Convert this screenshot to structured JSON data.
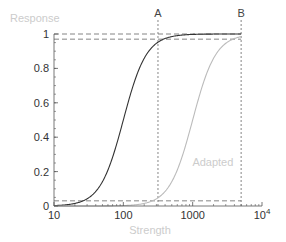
{
  "chart_data": {
    "type": "line",
    "title": "",
    "xlabel": "Strength",
    "ylabel": "Response",
    "xscale": "log",
    "xlim": [
      10,
      10000
    ],
    "ylim": [
      0,
      1
    ],
    "x_ticks": [
      {
        "value": 10,
        "label": "10"
      },
      {
        "value": 100,
        "label": "100"
      },
      {
        "value": 1000,
        "label": "1000"
      },
      {
        "value": 10000,
        "label": "10^4"
      }
    ],
    "y_ticks": [
      {
        "value": 0,
        "label": "0"
      },
      {
        "value": 0.2,
        "label": "0.2"
      },
      {
        "value": 0.4,
        "label": "0.4"
      },
      {
        "value": 0.6,
        "label": "0.6"
      },
      {
        "value": 0.8,
        "label": "0.8"
      },
      {
        "value": 1,
        "label": "1"
      }
    ],
    "series": [
      {
        "name": "Original",
        "color": "#333333",
        "half_max_x": 100,
        "hill_n": 2.6,
        "x": [
          10,
          20,
          30,
          50,
          70,
          100,
          150,
          200,
          316,
          500,
          1000,
          5000
        ],
        "values": [
          0.003,
          0.02,
          0.05,
          0.15,
          0.3,
          0.5,
          0.74,
          0.86,
          0.95,
          0.99,
          1.0,
          1.0
        ]
      },
      {
        "name": "Adapted",
        "color": "#bbbbbb",
        "half_max_x": 1000,
        "hill_n": 2.6,
        "x": [
          100,
          200,
          316,
          500,
          700,
          1000,
          1500,
          2000,
          3000,
          5000
        ],
        "values": [
          0.003,
          0.015,
          0.05,
          0.15,
          0.3,
          0.5,
          0.74,
          0.86,
          0.95,
          0.99
        ]
      }
    ],
    "annotations": [
      {
        "type": "vline",
        "label": "A",
        "x": 316
      },
      {
        "type": "vline",
        "label": "B",
        "x": 5000
      },
      {
        "type": "hline",
        "y": 1.0
      },
      {
        "type": "hline",
        "y": 0.97
      },
      {
        "type": "hline",
        "y": 0.03
      },
      {
        "type": "text",
        "label": "Adapted",
        "x": 1500,
        "y": 0.23
      }
    ],
    "grid": false,
    "legend": "none"
  },
  "colors": {
    "axis": "#555555",
    "label": "#cccccc",
    "curve_original": "#333333",
    "curve_adapted": "#bbbbbb",
    "guide": "#666666"
  }
}
